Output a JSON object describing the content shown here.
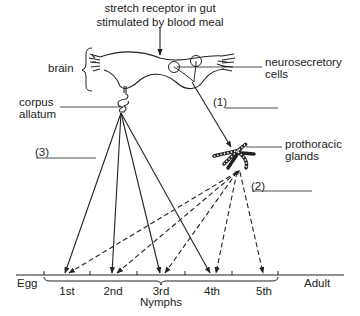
{
  "diagram": {
    "title_line1": "stretch receptor in gut",
    "title_line2": "stimulated by blood meal",
    "labels": {
      "brain": "brain",
      "neurosecretory_line1": "neurosecretory",
      "neurosecretory_line2": "cells",
      "corpus_line1": "corpus",
      "corpus_line2": "allatum",
      "prothoracic_line1": "prothoracic",
      "prothoracic_line2": "glands",
      "blank1": "(1)",
      "blank2": "(2)",
      "blank3": "(3)"
    },
    "timeline": {
      "start": "Egg",
      "end": "Adult",
      "stages": [
        "1st",
        "2nd",
        "3rd",
        "4th",
        "5th"
      ],
      "group_label": "Nymphs"
    },
    "colors": {
      "line": "#222222",
      "background": "#ffffff"
    }
  }
}
